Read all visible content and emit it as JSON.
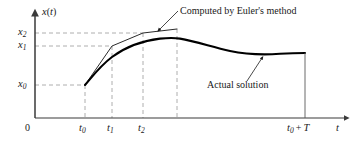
{
  "figure": {
    "title": "",
    "axes": {
      "y_axis_label": "x(t)",
      "y_axis_label_var": "x",
      "y_axis_label_paren_open": "(",
      "y_axis_label_t": "t",
      "y_axis_label_paren_close": ")",
      "x_axis_label": "t",
      "origin_label": "0"
    },
    "y_ticks": [
      {
        "name": "x2",
        "base": "x",
        "sub": "2",
        "value_y_px": 33
      },
      {
        "name": "x1",
        "base": "x",
        "sub": "1",
        "value_y_px": 46
      },
      {
        "name": "x0",
        "base": "x",
        "sub": "0",
        "value_y_px": 85
      }
    ],
    "x_ticks": [
      {
        "name": "t0",
        "base": "t",
        "sub": "0",
        "value_x_px": 85
      },
      {
        "name": "t1",
        "base": "t",
        "sub": "1",
        "value_x_px": 112
      },
      {
        "name": "t2",
        "base": "t",
        "sub": "2",
        "value_x_px": 143
      },
      {
        "name": "t0+T",
        "base": "t",
        "sub": "0",
        "operator": "+",
        "term": "T",
        "value_x_px": 305
      }
    ],
    "annotations": [
      {
        "name": "euler-annotation",
        "text": "Computed by Euler's method"
      },
      {
        "name": "actual-annotation",
        "text": "Actual solution"
      }
    ]
  },
  "chart_data": {
    "type": "line",
    "title": "",
    "xlabel": "t",
    "ylabel": "x(t)",
    "xlim": [
      0,
      357
    ],
    "ylim": [
      0,
      145
    ],
    "grid": "dashed-guides-only",
    "legend": "inline-annotations",
    "axis_origin_px": {
      "x": 35,
      "y": 118
    },
    "y_levels": {
      "x0": 85,
      "x1": 46,
      "x2": 33
    },
    "x_levels": {
      "t0": 85,
      "t1": 112,
      "t2": 143,
      "t0_plus_T": 305
    },
    "series": [
      {
        "name": "Computed by Euler's method",
        "style": "thin-polyline",
        "points_px": [
          [
            85,
            85
          ],
          [
            112,
            46
          ],
          [
            143,
            33
          ],
          [
            177,
            29
          ]
        ]
      },
      {
        "name": "Actual solution",
        "style": "thick-smooth-curve",
        "points_px": [
          [
            85,
            85
          ],
          [
            95,
            72
          ],
          [
            107,
            60
          ],
          [
            120,
            52
          ],
          [
            135,
            45
          ],
          [
            150,
            41
          ],
          [
            165,
            38.5
          ],
          [
            178,
            38
          ],
          [
            192,
            40
          ],
          [
            208,
            44
          ],
          [
            224,
            49
          ],
          [
            240,
            52
          ],
          [
            256,
            54
          ],
          [
            272,
            54
          ],
          [
            288,
            53
          ],
          [
            305,
            53
          ]
        ]
      }
    ],
    "guides": [
      {
        "name": "guide-x2",
        "orientation": "horizontal",
        "from_px": [
          35,
          33
        ],
        "to_px": [
          143,
          33
        ]
      },
      {
        "name": "guide-x1",
        "orientation": "horizontal",
        "from_px": [
          35,
          46
        ],
        "to_px": [
          112,
          46
        ]
      },
      {
        "name": "guide-x0",
        "orientation": "horizontal",
        "from_px": [
          35,
          85
        ],
        "to_px": [
          85,
          85
        ]
      },
      {
        "name": "guide-t0",
        "orientation": "vertical",
        "from_px": [
          85,
          85
        ],
        "to_px": [
          85,
          118
        ]
      },
      {
        "name": "guide-t1",
        "orientation": "vertical",
        "from_px": [
          112,
          46
        ],
        "to_px": [
          112,
          118
        ]
      },
      {
        "name": "guide-t2",
        "orientation": "vertical",
        "from_px": [
          143,
          33
        ],
        "to_px": [
          143,
          118
        ]
      },
      {
        "name": "guide-peak",
        "orientation": "vertical",
        "from_px": [
          177,
          29
        ],
        "to_px": [
          177,
          118
        ]
      }
    ],
    "leader_lines": [
      {
        "name": "euler-leader",
        "from_px": [
          177,
          12
        ],
        "to_px": [
          158,
          31
        ]
      },
      {
        "name": "actual-leader",
        "from_px": [
          248,
          82
        ],
        "to_px": [
          262,
          58
        ]
      }
    ],
    "colors": {
      "axis": "#3a3a3a",
      "curve": "#000000",
      "euler": "#2b2b2b",
      "guide": "#9a9a9a",
      "text": "#1a1a1a",
      "background": "#ffffff"
    }
  }
}
